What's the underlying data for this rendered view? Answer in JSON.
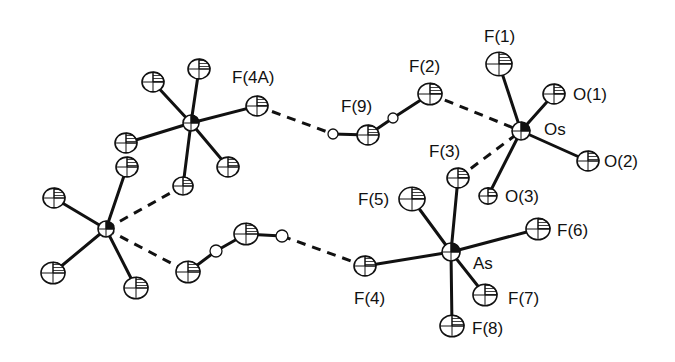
{
  "figure": {
    "colors": {
      "ink": "#111111",
      "background": "#ffffff"
    }
  },
  "atoms": [
    {
      "id": "Os",
      "label": "Os",
      "x": 521,
      "y": 131,
      "r": 9,
      "type": "metal",
      "label_pos": [
        544,
        121
      ]
    },
    {
      "id": "F1",
      "label": "F(1)",
      "x": 499,
      "y": 64,
      "r": 13,
      "type": "F",
      "label_pos": [
        484,
        28
      ]
    },
    {
      "id": "O1",
      "label": "O(1)",
      "x": 554,
      "y": 94,
      "r": 11,
      "type": "O",
      "label_pos": [
        573,
        86
      ]
    },
    {
      "id": "O2",
      "label": "O(2)",
      "x": 588,
      "y": 161,
      "r": 11,
      "type": "O",
      "label_pos": [
        604,
        153
      ]
    },
    {
      "id": "O3",
      "label": "O(3)",
      "x": 488,
      "y": 196,
      "r": 9,
      "type": "O",
      "label_pos": [
        505,
        188
      ]
    },
    {
      "id": "F2",
      "label": "F(2)",
      "x": 430,
      "y": 94,
      "r": 12,
      "type": "F",
      "label_pos": [
        409,
        58
      ]
    },
    {
      "id": "F3",
      "label": "F(3)",
      "x": 458,
      "y": 178,
      "r": 11,
      "type": "F",
      "label_pos": [
        429,
        143
      ]
    },
    {
      "id": "F9",
      "label": "F(9)",
      "x": 368,
      "y": 135,
      "r": 11,
      "type": "F",
      "label_pos": [
        341,
        98
      ]
    },
    {
      "id": "H9a",
      "label": "",
      "x": 393,
      "y": 118,
      "r": 4,
      "type": "H"
    },
    {
      "id": "H9b",
      "label": "",
      "x": 333,
      "y": 134,
      "r": 4,
      "type": "H"
    },
    {
      "id": "As",
      "label": "As",
      "x": 451,
      "y": 252,
      "r": 9,
      "type": "metal",
      "label_pos": [
        473,
        255
      ]
    },
    {
      "id": "F4",
      "label": "F(4)",
      "x": 365,
      "y": 266,
      "r": 11,
      "type": "F",
      "label_pos": [
        354,
        290
      ]
    },
    {
      "id": "F5",
      "label": "F(5)",
      "x": 412,
      "y": 199,
      "r": 13,
      "type": "F",
      "label_pos": [
        358,
        191
      ]
    },
    {
      "id": "F6",
      "label": "F(6)",
      "x": 538,
      "y": 229,
      "r": 12,
      "type": "F",
      "label_pos": [
        557,
        222
      ]
    },
    {
      "id": "F7",
      "label": "F(7)",
      "x": 485,
      "y": 295,
      "r": 12,
      "type": "F",
      "label_pos": [
        508,
        290
      ]
    },
    {
      "id": "F8",
      "label": "F(8)",
      "x": 452,
      "y": 326,
      "r": 12,
      "type": "F",
      "label_pos": [
        472,
        320
      ]
    },
    {
      "id": "AsA",
      "label": "",
      "x": 191,
      "y": 123,
      "r": 8,
      "type": "metal"
    },
    {
      "id": "F4A",
      "label": "F(4A)",
      "x": 257,
      "y": 106,
      "r": 11,
      "type": "F",
      "label_pos": [
        232,
        69
      ]
    },
    {
      "id": "FA1",
      "label": "",
      "x": 153,
      "y": 82,
      "r": 11,
      "type": "F"
    },
    {
      "id": "FA2",
      "label": "",
      "x": 199,
      "y": 69,
      "r": 11,
      "type": "F"
    },
    {
      "id": "FA3",
      "label": "",
      "x": 126,
      "y": 143,
      "r": 11,
      "type": "F"
    },
    {
      "id": "FA4",
      "label": "",
      "x": 228,
      "y": 167,
      "r": 11,
      "type": "F"
    },
    {
      "id": "FA5",
      "label": "",
      "x": 183,
      "y": 186,
      "r": 10,
      "type": "F"
    },
    {
      "id": "FA6",
      "label": "",
      "x": 127,
      "y": 167,
      "r": 11,
      "type": "F"
    },
    {
      "id": "AsB",
      "label": "",
      "x": 106,
      "y": 229,
      "r": 8,
      "type": "metal"
    },
    {
      "id": "FB1",
      "label": "",
      "x": 54,
      "y": 198,
      "r": 11,
      "type": "F"
    },
    {
      "id": "FB2",
      "label": "",
      "x": 53,
      "y": 273,
      "r": 12,
      "type": "F"
    },
    {
      "id": "FB3",
      "label": "",
      "x": 136,
      "y": 288,
      "r": 12,
      "type": "F"
    },
    {
      "id": "FC1",
      "label": "",
      "x": 188,
      "y": 272,
      "r": 12,
      "type": "F"
    },
    {
      "id": "HC1",
      "label": "",
      "x": 216,
      "y": 251,
      "r": 5,
      "type": "H"
    },
    {
      "id": "FC2",
      "label": "",
      "x": 246,
      "y": 234,
      "r": 12,
      "type": "F"
    },
    {
      "id": "HC2",
      "label": "",
      "x": 282,
      "y": 236,
      "r": 5,
      "type": "H"
    }
  ],
  "bonds": [
    [
      "Os",
      "F1"
    ],
    [
      "Os",
      "O1"
    ],
    [
      "Os",
      "O2"
    ],
    [
      "Os",
      "O3"
    ],
    [
      "As",
      "F3"
    ],
    [
      "As",
      "F4"
    ],
    [
      "As",
      "F5"
    ],
    [
      "As",
      "F6"
    ],
    [
      "As",
      "F7"
    ],
    [
      "As",
      "F8"
    ],
    [
      "F9",
      "H9a"
    ],
    [
      "F9",
      "H9b"
    ],
    [
      "H9a",
      "F2"
    ],
    [
      "AsA",
      "F4A"
    ],
    [
      "AsA",
      "FA1"
    ],
    [
      "AsA",
      "FA2"
    ],
    [
      "AsA",
      "FA3"
    ],
    [
      "AsA",
      "FA4"
    ],
    [
      "AsA",
      "FA5"
    ],
    [
      "AsB",
      "FA6"
    ],
    [
      "AsB",
      "FB1"
    ],
    [
      "AsB",
      "FB2"
    ],
    [
      "AsB",
      "FB3"
    ],
    [
      "FC1",
      "HC1"
    ],
    [
      "FC2",
      "HC1"
    ],
    [
      "FC2",
      "HC2"
    ]
  ],
  "contacts": [
    [
      "F2",
      "Os"
    ],
    [
      "F3",
      "Os"
    ],
    [
      "F4A",
      "H9b"
    ],
    [
      "HC2",
      "F4"
    ],
    [
      "AsB",
      "FA5"
    ],
    [
      "AsB",
      "FC1"
    ]
  ]
}
